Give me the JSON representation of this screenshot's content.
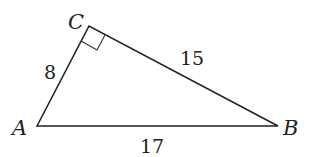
{
  "diagram": {
    "type": "right-triangle",
    "vertices": [
      {
        "name": "A",
        "x": 37,
        "y": 126
      },
      {
        "name": "C",
        "x": 89,
        "y": 26
      },
      {
        "name": "B",
        "x": 278,
        "y": 126
      }
    ],
    "labels": {
      "A": "A",
      "B": "B",
      "C": "C"
    },
    "sides": {
      "AC": "8",
      "CB": "15",
      "AB": "17"
    },
    "right_angle_at": "C",
    "stroke_color": "#222222"
  }
}
